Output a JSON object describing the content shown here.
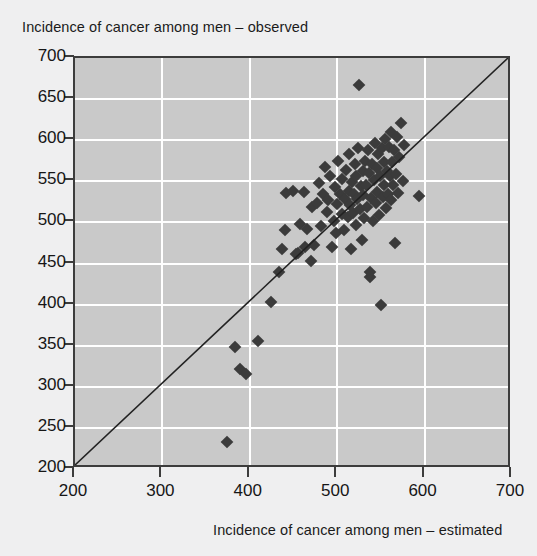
{
  "chart_data": {
    "type": "scatter",
    "title": "",
    "xlabel": "Incidence of cancer among men – estimated",
    "ylabel": "Incidence of cancer among men – observed",
    "xlim": [
      200,
      700
    ],
    "ylim": [
      200,
      700
    ],
    "xticks": [
      200,
      300,
      400,
      500,
      600,
      700
    ],
    "yticks": [
      200,
      250,
      300,
      350,
      400,
      450,
      500,
      550,
      600,
      650,
      700
    ],
    "xtick_labels": [
      "200",
      "300",
      "400",
      "500",
      "600",
      "700"
    ],
    "ytick_labels": [
      "200",
      "250",
      "300",
      "350",
      "400",
      "450",
      "500",
      "550",
      "600",
      "650",
      "700"
    ],
    "grid": true,
    "grid_color": "#ffffff",
    "plot_background": "#c9c9c9",
    "figure_background": "#efeff0",
    "marker_color": "#3b3b3b",
    "marker_shape": "diamond",
    "legend": null,
    "annotations": [],
    "reference_line": {
      "type": "identity",
      "label": "y = x",
      "from": [
        200,
        200
      ],
      "to": [
        700,
        700
      ],
      "color": "#222222"
    },
    "points": [
      [
        374,
        233
      ],
      [
        383,
        348
      ],
      [
        389,
        322
      ],
      [
        396,
        315
      ],
      [
        409,
        356
      ],
      [
        424,
        403
      ],
      [
        433,
        440
      ],
      [
        437,
        468
      ],
      [
        440,
        491
      ],
      [
        441,
        536
      ],
      [
        449,
        538
      ],
      [
        453,
        462
      ],
      [
        455,
        463
      ],
      [
        457,
        498
      ],
      [
        462,
        537
      ],
      [
        463,
        470
      ],
      [
        466,
        492
      ],
      [
        470,
        453
      ],
      [
        471,
        519
      ],
      [
        474,
        473
      ],
      [
        477,
        524
      ],
      [
        479,
        548
      ],
      [
        482,
        496
      ],
      [
        484,
        534
      ],
      [
        486,
        568
      ],
      [
        488,
        513
      ],
      [
        490,
        527
      ],
      [
        492,
        556
      ],
      [
        494,
        470
      ],
      [
        496,
        502
      ],
      [
        497,
        543
      ],
      [
        499,
        487
      ],
      [
        500,
        522
      ],
      [
        501,
        575
      ],
      [
        503,
        535
      ],
      [
        505,
        510
      ],
      [
        506,
        553
      ],
      [
        508,
        491
      ],
      [
        509,
        529
      ],
      [
        510,
        564
      ],
      [
        512,
        506
      ],
      [
        513,
        538
      ],
      [
        514,
        583
      ],
      [
        515,
        521
      ],
      [
        516,
        468
      ],
      [
        517,
        549
      ],
      [
        518,
        512
      ],
      [
        519,
        534
      ],
      [
        520,
        571
      ],
      [
        521,
        497
      ],
      [
        522,
        556
      ],
      [
        523,
        528
      ],
      [
        524,
        590
      ],
      [
        525,
        667
      ],
      [
        526,
        516
      ],
      [
        527,
        544
      ],
      [
        528,
        479
      ],
      [
        529,
        562
      ],
      [
        530,
        533
      ],
      [
        531,
        505
      ],
      [
        532,
        575
      ],
      [
        533,
        546
      ],
      [
        534,
        519
      ],
      [
        535,
        588
      ],
      [
        536,
        560
      ],
      [
        537,
        434
      ],
      [
        538,
        440
      ],
      [
        539,
        530
      ],
      [
        540,
        571
      ],
      [
        541,
        502
      ],
      [
        542,
        551
      ],
      [
        543,
        596
      ],
      [
        544,
        524
      ],
      [
        545,
        566
      ],
      [
        546,
        537
      ],
      [
        547,
        583
      ],
      [
        548,
        509
      ],
      [
        549,
        556
      ],
      [
        550,
        400
      ],
      [
        551,
        590
      ],
      [
        552,
        531
      ],
      [
        553,
        573
      ],
      [
        554,
        545
      ],
      [
        555,
        601
      ],
      [
        556,
        518
      ],
      [
        557,
        563
      ],
      [
        558,
        534
      ],
      [
        559,
        592
      ],
      [
        560,
        556
      ],
      [
        561,
        610
      ],
      [
        562,
        527
      ],
      [
        563,
        574
      ],
      [
        564,
        546
      ],
      [
        565,
        588
      ],
      [
        566,
        475
      ],
      [
        567,
        559
      ],
      [
        568,
        604
      ],
      [
        570,
        536
      ],
      [
        571,
        580
      ],
      [
        573,
        621
      ],
      [
        575,
        550
      ],
      [
        577,
        594
      ],
      [
        594,
        532
      ]
    ]
  },
  "axis": {
    "y_title": "Incidence of cancer among men – observed",
    "x_title": "Incidence of cancer among men – estimated"
  }
}
